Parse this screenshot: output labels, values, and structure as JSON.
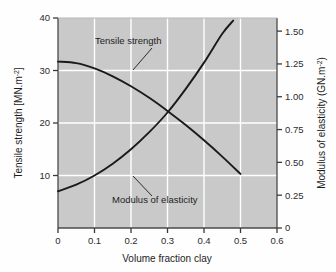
{
  "chart_data": {
    "type": "line",
    "title": "",
    "subtitle": "",
    "xlabel": "Volume fraction clay",
    "ylabel": "Tensile strength [MN.m",
    "ylabel_sup": "-2",
    "ylabel_tail": "]",
    "y2label": "Modulus of elasticity (GN.m",
    "y2label_sup": "-2",
    "y2label_tail": ")",
    "xlim": [
      0,
      0.6
    ],
    "ylim": [
      0,
      40
    ],
    "y2lim": [
      0,
      1.6
    ],
    "grid": true,
    "legend": "annotations-on-curves",
    "plot_background": "#c9c9c9",
    "line_color": "#1a1a1a",
    "grid_color": "#ffffff",
    "xticks": [
      "0",
      "0.1",
      "0.2",
      "0.3",
      "0.4",
      "0.5",
      "0.6"
    ],
    "xtick_values": [
      0,
      0.1,
      0.2,
      0.3,
      0.4,
      0.5,
      0.6
    ],
    "yticks": [
      "10",
      "20",
      "30",
      "40"
    ],
    "ytick_values": [
      10,
      20,
      30,
      40
    ],
    "y2ticks": [
      "0",
      "0.25",
      "0.50",
      "0.75",
      "1.00",
      "1.25",
      "1.50"
    ],
    "y2tick_values": [
      0,
      0.25,
      0.5,
      0.75,
      1.0,
      1.25,
      1.5
    ],
    "series": [
      {
        "name": "Tensile strength",
        "axis": "left",
        "units": "MN.m^-2",
        "x": [
          0.0,
          0.05,
          0.1,
          0.15,
          0.2,
          0.25,
          0.3,
          0.35,
          0.4,
          0.45,
          0.5
        ],
        "values": [
          31.7,
          31.4,
          30.4,
          28.9,
          27.0,
          24.8,
          22.3,
          19.6,
          16.7,
          13.6,
          10.3
        ]
      },
      {
        "name": "Modulus of elasticity",
        "axis": "right",
        "units": "GN.m^-2",
        "x": [
          0.0,
          0.05,
          0.1,
          0.15,
          0.2,
          0.25,
          0.3,
          0.35,
          0.4,
          0.45,
          0.48
        ],
        "values": [
          0.28,
          0.33,
          0.4,
          0.49,
          0.6,
          0.73,
          0.88,
          1.06,
          1.26,
          1.48,
          1.58
        ]
      }
    ],
    "annotations": [
      {
        "text": "Tensile strength",
        "label_x": 95,
        "label_y": 44,
        "leader": {
          "x1": 152,
          "y1": 48,
          "x2": 133,
          "y2": 70
        }
      },
      {
        "text": "Modulus of elasticity",
        "label_x": 112,
        "label_y": 203,
        "leader": {
          "x1": 152,
          "y1": 196,
          "x2": 133,
          "y2": 176
        }
      }
    ]
  }
}
